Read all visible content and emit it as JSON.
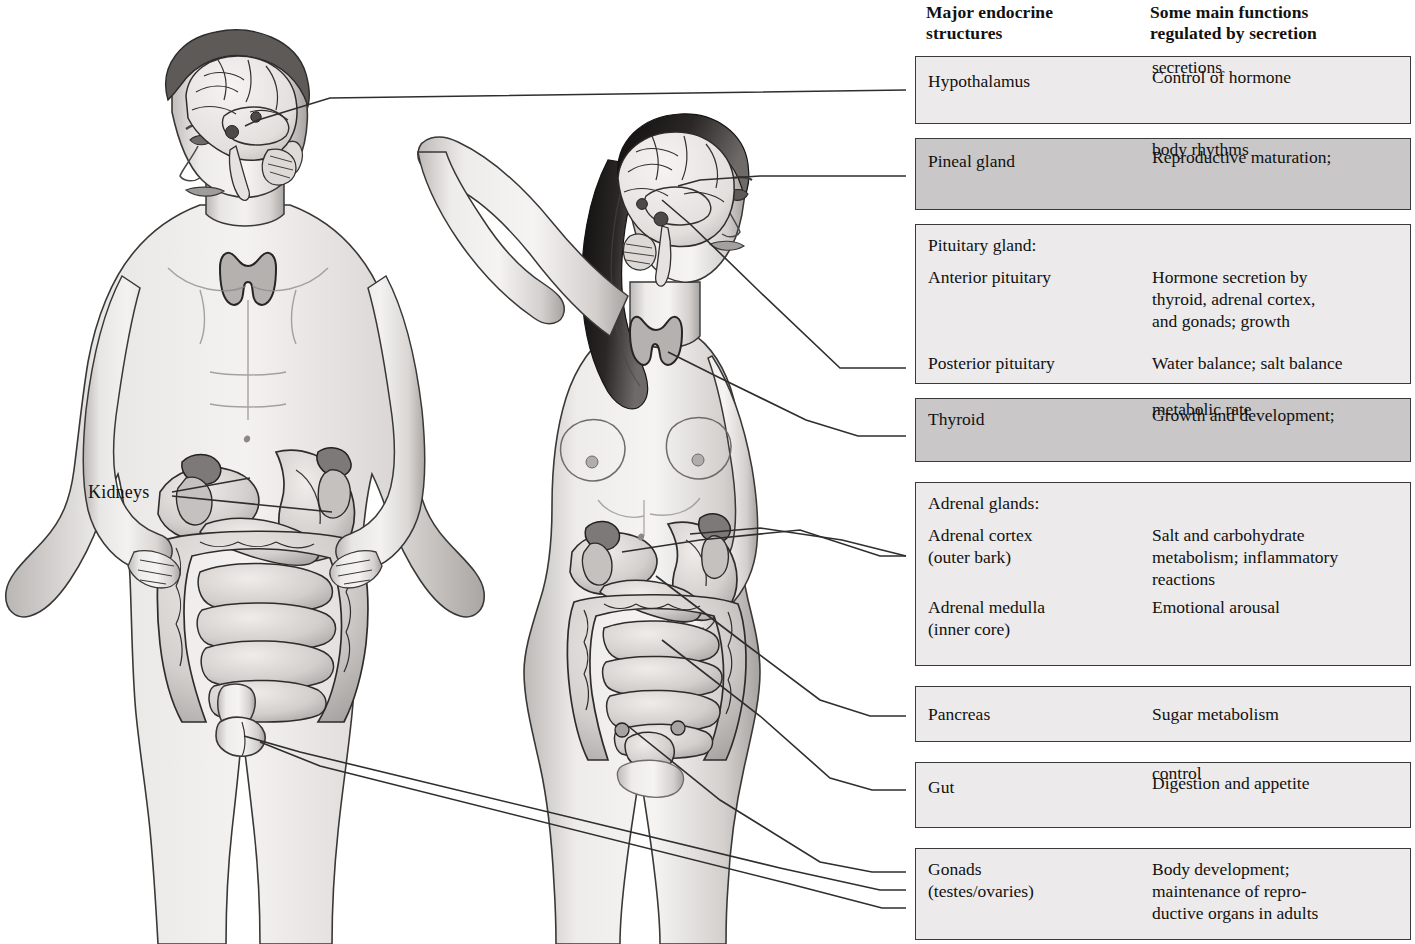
{
  "headers": {
    "col1": "Major endocrine structures",
    "col1_line1": "Major endocrine",
    "col1_line2": "structures",
    "col2_line1": "Some main functions",
    "col2_line2": "regulated by secretion"
  },
  "figure_labels": {
    "kidneys": "Kidneys"
  },
  "colors": {
    "row_light": "#eceaea",
    "row_dark": "#c9c7c7",
    "border": "#3a3a3a",
    "leader_line": "#2e2e2e",
    "skin_light": "#f2f0ef",
    "skin_mid": "#c9c6c4",
    "skin_shadow": "#9d9a98",
    "hair_dark": "#1d1b1a",
    "organ_fill": "#d8d5d3",
    "organ_dark": "#8d8a88",
    "brain_fill": "#ebe8e6"
  },
  "rows": [
    {
      "id": "hypothalamus",
      "shade": "light",
      "top": 56,
      "height": 68,
      "structure_lines": [
        "Hypothalamus"
      ],
      "function_lines": [
        "Control of hormone",
        "secretions"
      ],
      "struct_offsets": [
        14
      ],
      "func_offsets": [
        10
      ]
    },
    {
      "id": "pineal-gland",
      "shade": "dark",
      "top": 138,
      "height": 72,
      "structure_lines": [
        "Pineal gland"
      ],
      "function_lines": [
        "Reproductive maturation;",
        "body rhythms"
      ],
      "struct_offsets": [
        12
      ],
      "func_offsets": [
        8
      ]
    },
    {
      "id": "pituitary-gland",
      "shade": "light",
      "top": 224,
      "height": 160,
      "structure_lines": [
        "Pituitary gland:",
        "Anterior pituitary",
        "Posterior pituitary"
      ],
      "function_lines": [
        "Hormone secretion by",
        "thyroid, adrenal cortex,",
        "and gonads; growth",
        "Water balance; salt balance"
      ],
      "struct_offsets": [
        10,
        42,
        128
      ],
      "func_offsets": [
        42,
        64,
        86,
        128
      ]
    },
    {
      "id": "thyroid",
      "shade": "dark",
      "top": 398,
      "height": 64,
      "structure_lines": [
        "Thyroid"
      ],
      "function_lines": [
        "Growth and development;",
        "metabolic rate"
      ],
      "struct_offsets": [
        10
      ],
      "func_offsets": [
        6
      ]
    },
    {
      "id": "adrenal-glands",
      "shade": "light",
      "top": 482,
      "height": 184,
      "structure_lines": [
        "Adrenal glands:",
        "Adrenal cortex",
        "(outer bark)",
        "Adrenal medulla",
        "(inner core)"
      ],
      "function_lines": [
        "Salt and carbohydrate",
        "metabolism; inflammatory",
        "reactions",
        "Emotional arousal"
      ],
      "struct_offsets": [
        10,
        42,
        64,
        114,
        136
      ],
      "func_offsets": [
        42,
        64,
        86,
        114
      ]
    },
    {
      "id": "pancreas",
      "shade": "light",
      "top": 686,
      "height": 56,
      "structure_lines": [
        "Pancreas"
      ],
      "function_lines": [
        "Sugar metabolism"
      ],
      "struct_offsets": [
        17
      ],
      "func_offsets": [
        17
      ]
    },
    {
      "id": "gut",
      "shade": "light",
      "top": 762,
      "height": 66,
      "structure_lines": [
        "Gut"
      ],
      "function_lines": [
        "Digestion and appetite",
        "control"
      ],
      "struct_offsets": [
        14
      ],
      "func_offsets": [
        10
      ]
    },
    {
      "id": "gonads",
      "shade": "light",
      "top": 848,
      "height": 92,
      "structure_lines": [
        "Gonads",
        "(testes/ovaries)"
      ],
      "function_lines": [
        "Body development;",
        "maintenance of repro-",
        "ductive organs in adults"
      ],
      "struct_offsets": [
        10,
        32
      ],
      "func_offsets": [
        10,
        32,
        54
      ]
    }
  ],
  "leader_lines": [
    {
      "name": "hypothalamus-leader",
      "points": "245,126 258,120 330,98 906,90"
    },
    {
      "name": "pineal-leader",
      "points": "678,186 700,180 760,176 906,176"
    },
    {
      "name": "pituitary-leader",
      "points": "662,200 690,224 760,292 840,368 906,368"
    },
    {
      "name": "thyroid-leader",
      "points": "668,352 720,378 806,420 858,436 906,436"
    },
    {
      "name": "adrenal-cortex-leader",
      "points": "622,552 700,540 800,530 880,556 906,556"
    },
    {
      "name": "adrenal-medulla-leader",
      "points": "690,534 760,528 842,540 906,556"
    },
    {
      "name": "pancreas-leader",
      "points": "656,576 740,640 820,700 870,716 906,716"
    },
    {
      "name": "gut-leader",
      "points": "662,640 760,716 830,778 872,790 906,790"
    },
    {
      "name": "ovaries-leader",
      "points": "628,726 720,800 820,862 872,872 906,872"
    },
    {
      "name": "testes-leader-a",
      "points": "244,736 300,752 780,868 880,890 906,890"
    },
    {
      "name": "testes-leader-b",
      "points": "260,742 320,766 790,884 882,908 906,908"
    }
  ],
  "kidney_leaders": [
    {
      "name": "kidney-left-leader",
      "points": "172,492 250,478"
    },
    {
      "name": "kidney-right-leader",
      "points": "172,496 332,512"
    }
  ],
  "anatomy": {
    "male": {
      "name": "male-figure",
      "structures": [
        "brain",
        "hypothalamus",
        "pituitary",
        "thyroid",
        "kidneys",
        "adrenal-glands",
        "stomach",
        "liver",
        "intestines",
        "testes"
      ]
    },
    "female": {
      "name": "female-figure",
      "structures": [
        "brain",
        "pineal-gland",
        "pituitary",
        "thyroid",
        "kidneys",
        "adrenal-glands",
        "stomach",
        "pancreas",
        "intestines",
        "ovaries"
      ]
    }
  }
}
